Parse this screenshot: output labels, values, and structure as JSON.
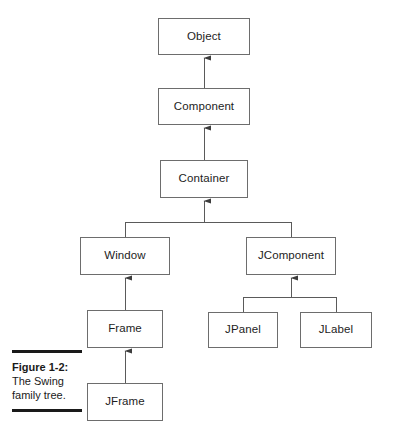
{
  "figure": {
    "caption_title": "Figure 1-2:",
    "caption_line_1": "The Swing",
    "caption_line_2": "family tree."
  },
  "colors": {
    "box_border": "#6d6d6d",
    "connector": "#5a5a5a",
    "text": "#1d1d1d",
    "caption_rule": "#1a1a1a",
    "background": "#ffffff"
  },
  "diagram": {
    "type": "class-hierarchy",
    "nodes": [
      {
        "id": "object",
        "label": "Object"
      },
      {
        "id": "component",
        "label": "Component"
      },
      {
        "id": "container",
        "label": "Container"
      },
      {
        "id": "window",
        "label": "Window"
      },
      {
        "id": "jcomponent",
        "label": "JComponent"
      },
      {
        "id": "frame",
        "label": "Frame"
      },
      {
        "id": "jpanel",
        "label": "JPanel"
      },
      {
        "id": "jlabel",
        "label": "JLabel"
      },
      {
        "id": "jframe",
        "label": "JFrame"
      }
    ],
    "edges": [
      {
        "from": "component",
        "to": "object",
        "relation": "inherits"
      },
      {
        "from": "container",
        "to": "component",
        "relation": "inherits"
      },
      {
        "from": "window",
        "to": "container",
        "relation": "inherits"
      },
      {
        "from": "jcomponent",
        "to": "container",
        "relation": "inherits"
      },
      {
        "from": "frame",
        "to": "window",
        "relation": "inherits"
      },
      {
        "from": "jpanel",
        "to": "jcomponent",
        "relation": "inherits"
      },
      {
        "from": "jlabel",
        "to": "jcomponent",
        "relation": "inherits"
      },
      {
        "from": "jframe",
        "to": "frame",
        "relation": "inherits"
      }
    ]
  }
}
